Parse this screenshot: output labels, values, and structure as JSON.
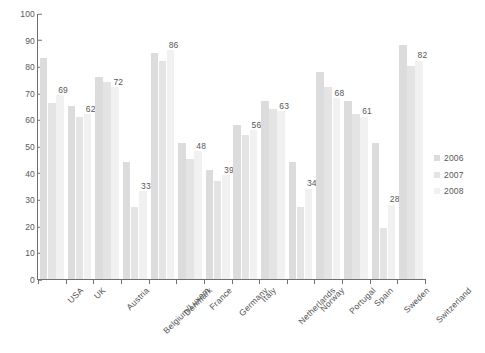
{
  "chart_data": {
    "type": "bar",
    "title": "",
    "subtitle": "",
    "xlabel": "",
    "ylabel": "",
    "ylim": [
      0,
      100
    ],
    "yticks": [
      0,
      10,
      20,
      30,
      40,
      50,
      60,
      70,
      80,
      90,
      100
    ],
    "grid": false,
    "legend_position": "right",
    "label_series": "2008",
    "categories": [
      "USA",
      "UK",
      "Austria",
      "Belgium/Luxem",
      "Denmark",
      "France",
      "Germany",
      "Italy",
      "Netherlands",
      "Norway",
      "Portugal",
      "Spain",
      "Sweden",
      "Switzerland"
    ],
    "series": [
      {
        "name": "2006",
        "color": "#dcdcdc",
        "values": [
          83,
          65,
          76,
          44,
          85,
          51,
          41,
          58,
          67,
          44,
          78,
          67,
          51,
          88
        ]
      },
      {
        "name": "2007",
        "color": "#e4e4e4",
        "values": [
          66,
          61,
          74,
          27,
          82,
          45,
          37,
          54,
          64,
          27,
          72,
          62,
          19,
          80
        ]
      },
      {
        "name": "2008",
        "color": "#f1f1f1",
        "values": [
          69,
          62,
          72,
          33,
          86,
          48,
          39,
          56,
          63,
          34,
          68,
          61,
          28,
          82
        ]
      }
    ],
    "data_labels": [
      69,
      62,
      72,
      33,
      86,
      48,
      39,
      56,
      63,
      34,
      68,
      61,
      28,
      82
    ]
  },
  "legend": {
    "items": [
      {
        "label": "2006"
      },
      {
        "label": "2007"
      },
      {
        "label": "2008"
      }
    ]
  }
}
